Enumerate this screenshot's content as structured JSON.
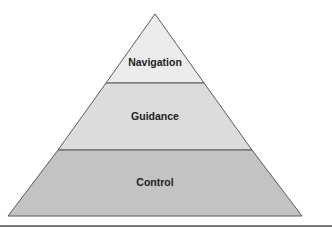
{
  "diagram": {
    "type": "pyramid",
    "tiers": [
      {
        "label": "Navigation",
        "level": "top",
        "fill": "#ececec"
      },
      {
        "label": "Guidance",
        "level": "middle",
        "fill": "#dcdcdc"
      },
      {
        "label": "Control",
        "level": "bottom",
        "fill": "#c3c3c3"
      }
    ],
    "stroke_color": "#5a5a5a",
    "rule_color": "#4a4a4a"
  }
}
